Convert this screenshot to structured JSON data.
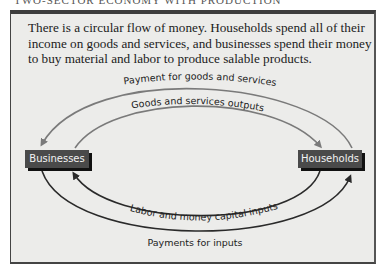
{
  "running_head": "TWO-SECTOR ECONOMY WITH PRODUCTION",
  "caption": "There is a circular flow of money. Households spend all of their income on goods and services, and businesses spend their money to buy material and labor to produce salable products.",
  "nodes": {
    "businesses": "Businesses",
    "households": "Households"
  },
  "flows": {
    "payment_goods_services": "Payment for goods and services",
    "goods_services_outputs": "Goods and services outputs",
    "labor_money_capital_inputs": "Labor and money capital inputs",
    "payments_for_inputs": "Payments for inputs"
  },
  "colors": {
    "frame_bg": "#ececea",
    "node_bg": "#4a4a4a",
    "top_arrow": "#7a7a7a",
    "bottom_arrow": "#2a2a2a"
  }
}
